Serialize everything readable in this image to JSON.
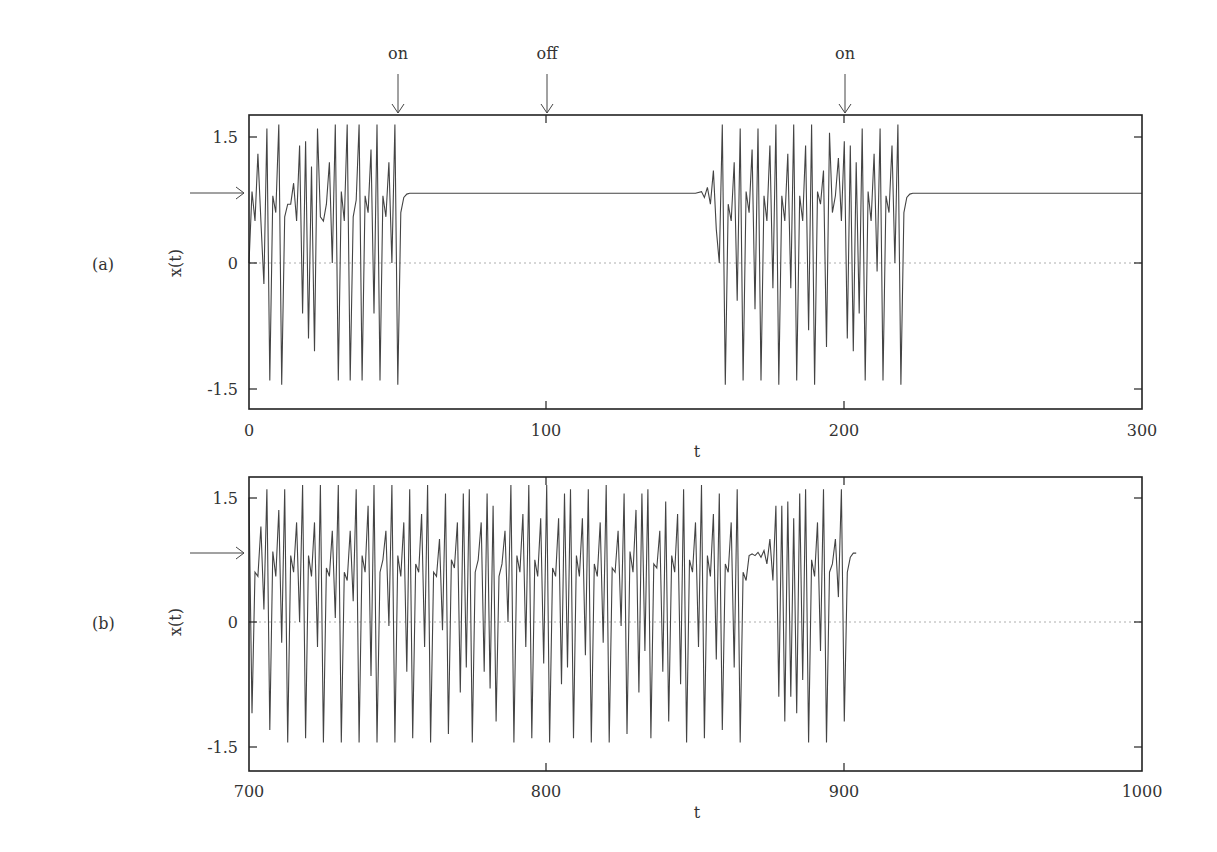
{
  "chart_data": [
    {
      "type": "line",
      "panel_label": "(a)",
      "title": "",
      "xlabel": "t",
      "ylabel": "x(t)",
      "xlim": [
        0,
        300
      ],
      "ylim": [
        -1.75,
        1.75
      ],
      "xticks": [
        "0",
        "100",
        "200",
        "300"
      ],
      "yticks": [
        "-1.5",
        "0",
        "1.5"
      ],
      "grid": false,
      "zero_line": "dotted",
      "fixed_point_marker": {
        "y": 0.83,
        "label": "arrow"
      },
      "annotations": [
        {
          "text": "on",
          "t": 50
        },
        {
          "text": "off",
          "t": 100
        },
        {
          "text": "on",
          "t": 200
        }
      ],
      "series": [
        {
          "name": "x(t)",
          "t": [
            0,
            1,
            2,
            3,
            4,
            5,
            6,
            7,
            8,
            9,
            10,
            11,
            12,
            13,
            14,
            15,
            16,
            17,
            18,
            19,
            20,
            21,
            22,
            23,
            24,
            25,
            26,
            27,
            28,
            29,
            30,
            31,
            32,
            33,
            34,
            35,
            36,
            37,
            38,
            39,
            40,
            41,
            42,
            43,
            44,
            45,
            46,
            47,
            48,
            49,
            50,
            51,
            52,
            53,
            54,
            55,
            56,
            60,
            100,
            150,
            152,
            153,
            154,
            155,
            156,
            157,
            158,
            159,
            160,
            161,
            162,
            163,
            164,
            165,
            166,
            167,
            168,
            169,
            170,
            171,
            172,
            173,
            174,
            175,
            176,
            177,
            178,
            179,
            180,
            181,
            182,
            183,
            184,
            185,
            186,
            187,
            188,
            189,
            190,
            191,
            192,
            193,
            194,
            195,
            196,
            197,
            198,
            199,
            200,
            201,
            202,
            203,
            204,
            205,
            206,
            207,
            208,
            209,
            210,
            211,
            212,
            213,
            214,
            215,
            216,
            217,
            218,
            219,
            220,
            221,
            222,
            223,
            224,
            225,
            226,
            227,
            228,
            229,
            230,
            231,
            232,
            233,
            240,
            300
          ],
          "values": [
            0.0,
            0.85,
            0.5,
            1.3,
            0.5,
            -0.25,
            1.6,
            -1.4,
            0.8,
            0.6,
            1.65,
            -1.45,
            0.55,
            0.7,
            0.7,
            0.95,
            0.5,
            1.4,
            -0.6,
            1.45,
            -0.9,
            1.15,
            -1.05,
            1.6,
            0.55,
            0.5,
            0.7,
            1.2,
            0.0,
            1.65,
            -1.4,
            0.85,
            0.5,
            1.65,
            -1.4,
            0.55,
            0.75,
            1.65,
            -1.4,
            0.8,
            0.6,
            1.35,
            -0.6,
            1.65,
            -1.4,
            0.8,
            0.55,
            1.2,
            0.0,
            1.65,
            -1.45,
            0.6,
            0.78,
            0.82,
            0.83,
            0.83,
            0.83,
            0.83,
            0.83,
            0.83,
            0.85,
            0.78,
            0.9,
            0.7,
            1.1,
            0.4,
            0.0,
            1.65,
            -1.45,
            0.7,
            0.5,
            1.2,
            -0.45,
            1.6,
            -1.4,
            0.85,
            0.6,
            1.35,
            -0.55,
            1.6,
            -1.4,
            0.8,
            0.5,
            1.4,
            -0.3,
            1.65,
            -1.45,
            0.8,
            0.5,
            1.3,
            -0.3,
            1.65,
            -1.4,
            0.8,
            0.5,
            1.4,
            -0.8,
            1.65,
            -1.45,
            0.85,
            0.7,
            1.1,
            -1.0,
            1.55,
            0.6,
            0.8,
            1.25,
            0.5,
            1.45,
            -0.9,
            1.4,
            -1.05,
            1.2,
            -0.6,
            1.6,
            -1.4,
            0.85,
            0.5,
            1.3,
            -0.1,
            1.6,
            -1.4,
            0.8,
            0.6,
            1.4,
            0.0,
            1.65,
            -1.45,
            0.6,
            0.78,
            0.82,
            0.83,
            0.83,
            0.83,
            0.83,
            0.83,
            0.83,
            0.83,
            0.83,
            0.83,
            0.83,
            0.83,
            0.83,
            0.83,
            0.83
          ]
        }
      ]
    },
    {
      "type": "line",
      "panel_label": "(b)",
      "title": "",
      "xlabel": "t",
      "ylabel": "x(t)",
      "xlim": [
        700,
        1000
      ],
      "ylim": [
        -1.75,
        1.75
      ],
      "xticks": [
        "700",
        "800",
        "900",
        "1000"
      ],
      "yticks": [
        "-1.5",
        "0",
        "1.5"
      ],
      "grid": false,
      "zero_line": "dotted",
      "fixed_point_marker": {
        "y": 0.83,
        "label": "arrow"
      },
      "series": [
        {
          "name": "x(t)",
          "values_description": "chaotic oscillation from t=700 until ~t=918, brief near-fixed-point lingering around t=885-890, then converges to fixed point x≈0.83 from t≈920 to 1000"
        }
      ]
    }
  ],
  "panels": {
    "a": {
      "label": "(a)",
      "ylabel": "x(t)",
      "xlabel": "t",
      "xticks": [
        "0",
        "100",
        "200",
        "300"
      ],
      "yticks": [
        "1.5",
        "0",
        "-1.5"
      ]
    },
    "b": {
      "label": "(b)",
      "ylabel": "x(t)",
      "xlabel": "t",
      "xticks": [
        "700",
        "800",
        "900",
        "1000"
      ],
      "yticks": [
        "1.5",
        "0",
        "-1.5"
      ]
    }
  },
  "annotations": [
    {
      "text": "on"
    },
    {
      "text": "off"
    },
    {
      "text": "on"
    }
  ],
  "trace_b": {
    "t": [
      700,
      701,
      702,
      703,
      704,
      705,
      706,
      707,
      708,
      709,
      710,
      711,
      712,
      713,
      714,
      715,
      716,
      717,
      718,
      719,
      720,
      721,
      722,
      723,
      724,
      725,
      726,
      727,
      728,
      729,
      730,
      731,
      732,
      733,
      734,
      735,
      736,
      737,
      738,
      739,
      740,
      741,
      742,
      743,
      744,
      745,
      746,
      747,
      748,
      749,
      750,
      751,
      752,
      753,
      754,
      755,
      756,
      757,
      758,
      759,
      760,
      761,
      762,
      763,
      764,
      765,
      766,
      767,
      768,
      769,
      770,
      771,
      772,
      773,
      774,
      775,
      776,
      777,
      778,
      779,
      780,
      781,
      782,
      783,
      784,
      785,
      786,
      787,
      788,
      789,
      790,
      791,
      792,
      793,
      794,
      795,
      796,
      797,
      798,
      799,
      800,
      801,
      802,
      803,
      804,
      805,
      806,
      807,
      808,
      809,
      810,
      811,
      812,
      813,
      814,
      815,
      816,
      817,
      818,
      819,
      820,
      821,
      822,
      823,
      824,
      825,
      826,
      827,
      828,
      829,
      830,
      831,
      832,
      833,
      834,
      835,
      836,
      837,
      838,
      839,
      840,
      841,
      842,
      843,
      844,
      845,
      846,
      847,
      848,
      849,
      850,
      851,
      852,
      853,
      854,
      855,
      856,
      857,
      858,
      859,
      860,
      861,
      862,
      863,
      864,
      865,
      866,
      867,
      868,
      869,
      870,
      871,
      872,
      873,
      874,
      875,
      876,
      877,
      878,
      879,
      880,
      881,
      882,
      883,
      884,
      885,
      886,
      887,
      888,
      889,
      890,
      891,
      892,
      893,
      894,
      895,
      896,
      897,
      898,
      899,
      900,
      901,
      902,
      903,
      904,
      905,
      906,
      907,
      908,
      909,
      910,
      911,
      912,
      913,
      914,
      915,
      916,
      917,
      918,
      919,
      920,
      922,
      925,
      1000
    ],
    "values": [
      1.5,
      -1.1,
      0.6,
      0.55,
      1.15,
      0.15,
      1.6,
      -1.3,
      0.85,
      0.55,
      1.35,
      -0.25,
      1.6,
      -1.45,
      0.8,
      0.6,
      1.2,
      0.0,
      1.65,
      -1.4,
      0.8,
      0.55,
      1.2,
      -0.3,
      1.65,
      -1.45,
      0.65,
      0.55,
      1.1,
      0.05,
      1.65,
      -1.45,
      0.6,
      0.5,
      1.1,
      0.25,
      1.6,
      -1.45,
      0.8,
      0.6,
      1.4,
      -0.65,
      1.65,
      -1.45,
      0.6,
      0.75,
      1.1,
      -0.05,
      1.65,
      -1.45,
      0.8,
      0.55,
      1.2,
      -0.6,
      1.6,
      -1.4,
      0.7,
      0.6,
      1.3,
      -0.3,
      1.65,
      -1.45,
      0.6,
      0.55,
      1.0,
      -0.1,
      1.55,
      -1.35,
      0.75,
      0.65,
      1.2,
      -0.85,
      1.55,
      -0.55,
      1.6,
      -1.45,
      0.6,
      0.75,
      1.2,
      -0.6,
      1.55,
      -0.8,
      1.4,
      -1.2,
      0.55,
      0.7,
      1.1,
      0.0,
      1.65,
      -1.45,
      0.8,
      0.6,
      1.3,
      -0.3,
      1.65,
      -1.4,
      0.75,
      0.55,
      1.25,
      -0.5,
      1.65,
      -1.45,
      0.65,
      0.55,
      1.25,
      -0.75,
      1.55,
      -0.55,
      1.6,
      -1.4,
      0.8,
      0.55,
      1.25,
      -0.4,
      1.6,
      -1.45,
      0.7,
      0.55,
      1.2,
      -0.25,
      1.65,
      -1.45,
      0.65,
      0.6,
      1.1,
      -0.05,
      1.55,
      -1.35,
      0.85,
      0.6,
      1.35,
      -0.85,
      1.55,
      -0.35,
      1.6,
      -1.4,
      0.7,
      0.65,
      1.1,
      -0.6,
      1.45,
      -1.2,
      0.8,
      0.6,
      1.3,
      -0.75,
      1.6,
      -1.45,
      0.75,
      0.6,
      1.2,
      -0.3,
      1.65,
      -1.4,
      0.8,
      0.55,
      1.3,
      -0.45,
      1.55,
      -1.3,
      0.7,
      0.6,
      1.2,
      -0.55,
      1.6,
      -1.45,
      0.6,
      0.5,
      0.8,
      0.82,
      0.8,
      0.84,
      0.78,
      0.86,
      0.7,
      1.0,
      0.5,
      1.4,
      -0.9,
      1.4,
      -1.2,
      1.45,
      -0.9,
      1.25,
      -1.1,
      1.55,
      -0.7,
      1.6,
      -1.45,
      0.75,
      0.55,
      1.2,
      -0.35,
      1.6,
      -1.45,
      0.6,
      0.7,
      1.0,
      0.3,
      1.6,
      -1.2,
      0.6,
      0.78,
      0.83,
      0.83
    ]
  }
}
